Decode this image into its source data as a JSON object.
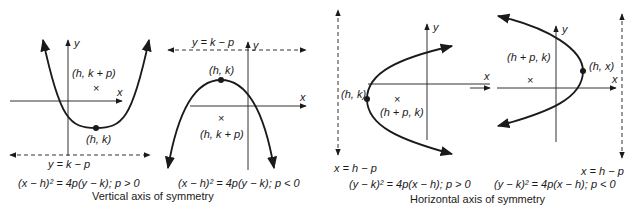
{
  "panels": [
    {
      "id": "vertical-up",
      "axis_y_label": "y",
      "axis_x_label": "x",
      "focus_label": "(h, k + p)",
      "vertex_label": "(h, k)",
      "directrix_label": "y = k − p",
      "equation": "(x − h)² = 4p(y − k); p > 0"
    },
    {
      "id": "vertical-down",
      "axis_y_label": "y",
      "axis_x_label": "x",
      "focus_label": "(h, k + p)",
      "vertex_label": "(h, k)",
      "directrix_label": "y = k − p",
      "equation": "(x − h)² = 4p(y − k); p < 0"
    },
    {
      "id": "horizontal-right",
      "axis_y_label": "y",
      "axis_x_label": "x",
      "focus_label": "(h + p, k)",
      "vertex_label": "(h, k)",
      "directrix_label": "x = h − p",
      "equation": "(y − k)² = 4p(x − h); p > 0"
    },
    {
      "id": "horizontal-left",
      "axis_y_label": "y",
      "axis_x_label": "x",
      "focus_label": "(h + p, k)",
      "vertex_label": "(h, x)",
      "directrix_label": "x = h − p",
      "equation": "(y − k)² = 4p(x − h); p < 0"
    }
  ],
  "captions": {
    "vertical": "Vertical axis of symmetry",
    "horizontal": "Horizontal axis of symmetry"
  },
  "focus_marker": "×"
}
